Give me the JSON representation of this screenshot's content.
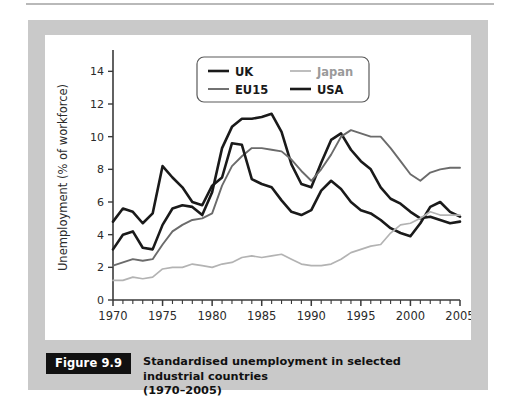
{
  "figure": {
    "tag": "Figure 9.9",
    "caption_line1": "Standardised unemployment in selected industrial countries",
    "caption_line2": "(1970–2005)"
  },
  "colors": {
    "panel_gray": "#c9c9c9",
    "plot_white": "#ffffff",
    "uk_line": "#1a1a1a",
    "usa_line": "#1a1a1a",
    "eu15_line": "#6b6b6b",
    "japan_line": "#b3b3b3",
    "axis": "#3a3a3a",
    "tag_background": "#111111",
    "tag_text": "#ffffff"
  },
  "legend": {
    "entries": [
      {
        "label": "UK",
        "color": "#1a1a1a",
        "width": 2.6
      },
      {
        "label": "Japan",
        "color": "#b3b3b3",
        "width": 1.7
      },
      {
        "label": "EU15",
        "color": "#6b6b6b",
        "width": 1.9
      },
      {
        "label": "USA",
        "color": "#1a1a1a",
        "width": 2.6
      }
    ]
  },
  "chart_data": {
    "type": "line",
    "title": "Standardised unemployment in selected industrial countries (1970–2005)",
    "xlabel": "",
    "ylabel": "Unemployment (% of workforce)",
    "xlim": [
      1970,
      2005
    ],
    "ylim": [
      0,
      15
    ],
    "y_ticks": [
      0,
      2,
      4,
      6,
      8,
      10,
      12,
      14
    ],
    "y_tick_labels": [
      "0",
      "2",
      "4",
      "6",
      "8",
      "10",
      "12",
      "14"
    ],
    "x_ticks": [
      1970,
      1975,
      1980,
      1985,
      1990,
      1995,
      2000,
      2005
    ],
    "x_tick_labels": [
      "1970",
      "1975",
      "1980",
      "1985",
      "1990",
      "1995",
      "2000",
      "2005"
    ],
    "x_minor_tick_step": 1,
    "grid": false,
    "legend_position": "top-center",
    "x": [
      1970,
      1971,
      1972,
      1973,
      1974,
      1975,
      1976,
      1977,
      1978,
      1979,
      1980,
      1981,
      1982,
      1983,
      1984,
      1985,
      1986,
      1987,
      1988,
      1989,
      1990,
      1991,
      1992,
      1993,
      1994,
      1995,
      1996,
      1997,
      1998,
      1999,
      2000,
      2001,
      2002,
      2003,
      2004,
      2005
    ],
    "series": [
      {
        "name": "UK",
        "color": "#1a1a1a",
        "width": 2.6,
        "values": [
          3.1,
          4.0,
          4.2,
          3.2,
          3.1,
          4.6,
          5.6,
          5.8,
          5.7,
          5.2,
          6.6,
          9.3,
          10.6,
          11.1,
          11.1,
          11.2,
          11.4,
          10.3,
          8.3,
          7.1,
          6.9,
          8.4,
          9.8,
          10.2,
          9.2,
          8.5,
          8.0,
          6.9,
          6.2,
          5.9,
          5.4,
          5.0,
          5.1,
          4.9,
          4.7,
          4.8
        ]
      },
      {
        "name": "EU15",
        "color": "#6b6b6b",
        "width": 1.9,
        "values": [
          2.1,
          2.3,
          2.5,
          2.4,
          2.5,
          3.4,
          4.2,
          4.6,
          4.9,
          5.0,
          5.3,
          7.0,
          8.2,
          8.8,
          9.3,
          9.3,
          9.2,
          9.1,
          8.6,
          7.9,
          7.3,
          8.0,
          8.9,
          10.0,
          10.4,
          10.2,
          10.0,
          10.0,
          9.3,
          8.5,
          7.7,
          7.3,
          7.8,
          8.0,
          8.1,
          8.1
        ]
      },
      {
        "name": "USA",
        "color": "#1a1a1a",
        "width": 2.6,
        "values": [
          4.8,
          5.6,
          5.4,
          4.7,
          5.3,
          8.2,
          7.5,
          6.9,
          6.0,
          5.8,
          7.0,
          7.5,
          9.6,
          9.5,
          7.4,
          7.1,
          6.9,
          6.1,
          5.4,
          5.2,
          5.5,
          6.7,
          7.3,
          6.8,
          6.0,
          5.5,
          5.3,
          4.9,
          4.4,
          4.1,
          3.9,
          4.7,
          5.7,
          6.0,
          5.4,
          5.1
        ]
      },
      {
        "name": "Japan",
        "color": "#b3b3b3",
        "width": 1.7,
        "values": [
          1.2,
          1.2,
          1.4,
          1.3,
          1.4,
          1.9,
          2.0,
          2.0,
          2.2,
          2.1,
          2.0,
          2.2,
          2.3,
          2.6,
          2.7,
          2.6,
          2.7,
          2.8,
          2.5,
          2.2,
          2.1,
          2.1,
          2.2,
          2.5,
          2.9,
          3.1,
          3.3,
          3.4,
          4.1,
          4.6,
          4.7,
          5.0,
          5.4,
          5.2,
          5.2,
          5.2
        ]
      }
    ]
  }
}
